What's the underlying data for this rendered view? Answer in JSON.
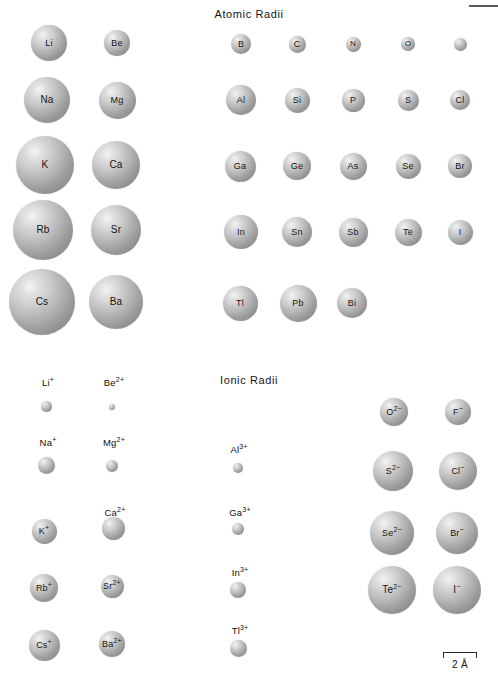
{
  "figure": {
    "sections": [
      {
        "id": "atomic",
        "title": "Atomic Radii",
        "title_x": 249,
        "title_y": 8
      },
      {
        "id": "ionic",
        "title": "Ionic Radii",
        "title_x": 249,
        "title_y": 374
      }
    ],
    "scale_bar": {
      "label": "2 Å",
      "x": 443,
      "y": 652,
      "width": 34
    },
    "top_rule": {
      "x": 469,
      "y": 5,
      "width": 29,
      "height": 2
    }
  },
  "chart_data": {
    "type": "scatter",
    "xlabel": "",
    "ylabel": "",
    "legend": "none",
    "grid": false,
    "scale_reference": "2 Å",
    "panels": [
      {
        "name": "Atomic Radii",
        "units": "Å",
        "points": [
          {
            "label": "Li",
            "cx": 49,
            "cy": 43,
            "r": 18.0,
            "radius_angstrom": 1.52,
            "label_inside": true
          },
          {
            "label": "Be",
            "cx": 117,
            "cy": 43,
            "r": 13.0,
            "radius_angstrom": 1.11,
            "label_inside": true
          },
          {
            "label": "B",
            "cx": 241,
            "cy": 44,
            "r": 10.0,
            "radius_angstrom": 0.88,
            "label_inside": true
          },
          {
            "label": "C",
            "cx": 297,
            "cy": 44,
            "r": 8.5,
            "radius_angstrom": 0.77,
            "label_inside": true
          },
          {
            "label": "N",
            "cx": 353,
            "cy": 44,
            "r": 7.5,
            "radius_angstrom": 0.7,
            "label_inside": true
          },
          {
            "label": "O",
            "cx": 408,
            "cy": 44,
            "r": 7.0,
            "radius_angstrom": 0.66,
            "label_inside": true
          },
          {
            "label": "F",
            "cx": 460,
            "cy": 44,
            "r": 6.5,
            "radius_angstrom": 0.64,
            "label_inside": true
          },
          {
            "label": "Na",
            "cx": 47,
            "cy": 100,
            "r": 23.0,
            "radius_angstrom": 1.86,
            "label_inside": true
          },
          {
            "label": "Mg",
            "cx": 117,
            "cy": 100,
            "r": 18.5,
            "radius_angstrom": 1.6,
            "label_inside": true
          },
          {
            "label": "Al",
            "cx": 241,
            "cy": 100,
            "r": 15.0,
            "radius_angstrom": 1.43,
            "label_inside": true
          },
          {
            "label": "Si",
            "cx": 297,
            "cy": 100,
            "r": 12.5,
            "radius_angstrom": 1.17,
            "label_inside": true
          },
          {
            "label": "P",
            "cx": 353,
            "cy": 100,
            "r": 11.5,
            "radius_angstrom": 1.1,
            "label_inside": true
          },
          {
            "label": "S",
            "cx": 408,
            "cy": 100,
            "r": 10.5,
            "radius_angstrom": 1.04,
            "label_inside": true
          },
          {
            "label": "Cl",
            "cx": 460,
            "cy": 100,
            "r": 10.0,
            "radius_angstrom": 0.99,
            "label_inside": true
          },
          {
            "label": "K",
            "cx": 45,
            "cy": 165,
            "r": 29.0,
            "radius_angstrom": 2.31,
            "label_inside": true
          },
          {
            "label": "Ca",
            "cx": 116,
            "cy": 165,
            "r": 24.0,
            "radius_angstrom": 1.97,
            "label_inside": true
          },
          {
            "label": "Ga",
            "cx": 240,
            "cy": 166,
            "r": 15.5,
            "radius_angstrom": 1.41,
            "label_inside": true
          },
          {
            "label": "Ge",
            "cx": 297,
            "cy": 166,
            "r": 14.0,
            "radius_angstrom": 1.22,
            "label_inside": true
          },
          {
            "label": "As",
            "cx": 353,
            "cy": 166,
            "r": 13.5,
            "radius_angstrom": 1.21,
            "label_inside": true
          },
          {
            "label": "Se",
            "cx": 408,
            "cy": 166,
            "r": 12.5,
            "radius_angstrom": 1.17,
            "label_inside": true
          },
          {
            "label": "Br",
            "cx": 460,
            "cy": 166,
            "r": 12.0,
            "radius_angstrom": 1.14,
            "label_inside": true
          },
          {
            "label": "Rb",
            "cx": 43,
            "cy": 230,
            "r": 30.0,
            "radius_angstrom": 2.44,
            "label_inside": true
          },
          {
            "label": "Sr",
            "cx": 116,
            "cy": 230,
            "r": 25.0,
            "radius_angstrom": 2.15,
            "label_inside": true
          },
          {
            "label": "In",
            "cx": 241,
            "cy": 232,
            "r": 17.0,
            "radius_angstrom": 1.66,
            "label_inside": true
          },
          {
            "label": "Sn",
            "cx": 297,
            "cy": 232,
            "r": 15.0,
            "radius_angstrom": 1.4,
            "label_inside": true
          },
          {
            "label": "Sb",
            "cx": 353,
            "cy": 232,
            "r": 14.5,
            "radius_angstrom": 1.41,
            "label_inside": true
          },
          {
            "label": "Te",
            "cx": 408,
            "cy": 232,
            "r": 13.5,
            "radius_angstrom": 1.37,
            "label_inside": true
          },
          {
            "label": "I",
            "cx": 460,
            "cy": 232,
            "r": 12.5,
            "radius_angstrom": 1.33,
            "label_inside": true
          },
          {
            "label": "Cs",
            "cx": 42,
            "cy": 302,
            "r": 33.0,
            "radius_angstrom": 2.62,
            "label_inside": true
          },
          {
            "label": "Ba",
            "cx": 116,
            "cy": 302,
            "r": 27.0,
            "radius_angstrom": 2.17,
            "label_inside": true
          },
          {
            "label": "Tl",
            "cx": 240,
            "cy": 303,
            "r": 17.5,
            "radius_angstrom": 1.71,
            "label_inside": true
          },
          {
            "label": "Pb",
            "cx": 298,
            "cy": 303,
            "r": 18.5,
            "radius_angstrom": 1.75,
            "label_inside": true
          },
          {
            "label": "Bi",
            "cx": 352,
            "cy": 303,
            "r": 15.0,
            "radius_angstrom": 1.46,
            "label_inside": true
          }
        ]
      },
      {
        "name": "Ionic Radii",
        "units": "Å",
        "points": [
          {
            "label": "Li",
            "charge": "+",
            "cx": 46,
            "cy": 406,
            "r": 5.5,
            "radius_angstrom": 0.9,
            "label_inside": false,
            "label_x": 48,
            "label_y": 378
          },
          {
            "label": "Be",
            "charge": "2+",
            "cx": 112,
            "cy": 407,
            "r": 3.0,
            "radius_angstrom": 0.59,
            "label_inside": false,
            "label_x": 114,
            "label_y": 378
          },
          {
            "label": "O",
            "charge": "2−",
            "cx": 394,
            "cy": 412,
            "r": 14.0,
            "radius_angstrom": 1.26,
            "label_inside": true
          },
          {
            "label": "F",
            "charge": "−",
            "cx": 458,
            "cy": 412,
            "r": 13.0,
            "radius_angstrom": 1.19,
            "label_inside": true
          },
          {
            "label": "Na",
            "charge": "+",
            "cx": 46,
            "cy": 465,
            "r": 8.5,
            "radius_angstrom": 1.16,
            "label_inside": false,
            "label_x": 48,
            "label_y": 438
          },
          {
            "label": "Mg",
            "charge": "2+",
            "cx": 112,
            "cy": 466,
            "r": 6.0,
            "radius_angstrom": 0.86,
            "label_inside": false,
            "label_x": 114,
            "label_y": 438
          },
          {
            "label": "Al",
            "charge": "3+",
            "cx": 238,
            "cy": 468,
            "r": 5.0,
            "radius_angstrom": 0.68,
            "label_inside": false,
            "label_x": 239,
            "label_y": 445
          },
          {
            "label": "S",
            "charge": "2−",
            "cx": 393,
            "cy": 471,
            "r": 20.0,
            "radius_angstrom": 1.7,
            "label_inside": true
          },
          {
            "label": "Cl",
            "charge": "−",
            "cx": 458,
            "cy": 471,
            "r": 19.0,
            "radius_angstrom": 1.67,
            "label_inside": true
          },
          {
            "label": "K",
            "charge": "+",
            "cx": 44,
            "cy": 531,
            "r": 12.5,
            "radius_angstrom": 1.52,
            "label_inside": true
          },
          {
            "label": "Ca",
            "charge": "2+",
            "cx": 113,
            "cy": 528,
            "r": 11.5,
            "radius_angstrom": 1.14,
            "label_inside": false,
            "label_x": 115,
            "label_y": 508
          },
          {
            "label": "Ga",
            "charge": "3+",
            "cx": 238,
            "cy": 529,
            "r": 6.0,
            "radius_angstrom": 0.76,
            "label_inside": false,
            "label_x": 240,
            "label_y": 508
          },
          {
            "label": "Se",
            "charge": "2−",
            "cx": 392,
            "cy": 533,
            "r": 22.0,
            "radius_angstrom": 1.84,
            "label_inside": true
          },
          {
            "label": "Br",
            "charge": "−",
            "cx": 457,
            "cy": 533,
            "r": 21.0,
            "radius_angstrom": 1.82,
            "label_inside": true
          },
          {
            "label": "Rb",
            "charge": "+",
            "cx": 44,
            "cy": 588,
            "r": 14.0,
            "radius_angstrom": 1.66,
            "label_inside": true
          },
          {
            "label": "Sr",
            "charge": "2+",
            "cx": 112,
            "cy": 586,
            "r": 11.5,
            "radius_angstrom": 1.32,
            "label_inside": true
          },
          {
            "label": "In",
            "charge": "3+",
            "cx": 238,
            "cy": 590,
            "r": 8.0,
            "radius_angstrom": 0.94,
            "label_inside": false,
            "label_x": 240,
            "label_y": 568
          },
          {
            "label": "Te",
            "charge": "2−",
            "cx": 392,
            "cy": 590,
            "r": 24.0,
            "radius_angstrom": 2.07,
            "label_inside": true
          },
          {
            "label": "I",
            "charge": "−",
            "cx": 457,
            "cy": 590,
            "r": 24.0,
            "radius_angstrom": 2.06,
            "label_inside": true
          },
          {
            "label": "Cs",
            "charge": "+",
            "cx": 44,
            "cy": 645,
            "r": 15.5,
            "radius_angstrom": 1.81,
            "label_inside": true
          },
          {
            "label": "Ba",
            "charge": "2+",
            "cx": 112,
            "cy": 644,
            "r": 13.0,
            "radius_angstrom": 1.49,
            "label_inside": true
          },
          {
            "label": "Tl",
            "charge": "3+",
            "cx": 238,
            "cy": 648,
            "r": 8.5,
            "radius_angstrom": 1.03,
            "label_inside": false,
            "label_x": 240,
            "label_y": 626
          }
        ]
      }
    ]
  }
}
